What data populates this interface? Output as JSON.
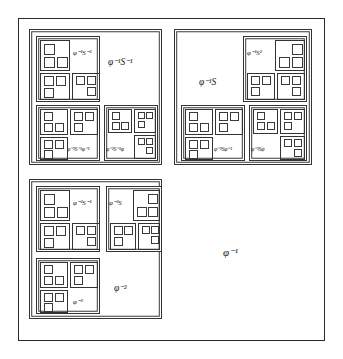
{
  "figure": {
    "frame": {
      "x": 18,
      "y": 18,
      "w": 307,
      "h": 323
    },
    "stroke_color": "#333333",
    "background_color": "#ffffff",
    "text_color": "#1a1a1a"
  },
  "labels": {
    "root": "φ⁻¹",
    "top_left_region": "φ⁻¹S⁻¹",
    "top_left_inner": "φ⁻¹S⁻²",
    "top_left_bl": "φ⁻¹S⁻¹φ⁻¹",
    "top_left_br": "φ⁻¹S⁻¹φ",
    "top_right_region": "φ⁻¹S",
    "top_right_inner": "φ⁻¹S²",
    "top_right_bl": "φ⁻¹Sφ⁻¹",
    "top_right_br": "φ⁻¹Sφ",
    "bottom_left_region": "φ⁻²",
    "bottom_left_inner": "φ⁻²S⁻¹",
    "bottom_left_mid": "φ⁻²S",
    "bottom_left_low": "φ⁻³"
  },
  "label_parts": {
    "root": {
      "base": "φ",
      "exp": "-1"
    },
    "top_left_region": {
      "base": "φ",
      "exp": "-1",
      "mid": "S",
      "exp2": "-1"
    },
    "top_left_inner": {
      "base": "φ",
      "exp": "-1",
      "mid": "S",
      "exp2": "-2"
    },
    "top_right_region": {
      "base": "φ",
      "exp": "-1",
      "mid": "S"
    },
    "top_right_inner": {
      "base": "φ",
      "exp": "-1",
      "mid": "S",
      "exp2": "2"
    },
    "bottom_left_region": {
      "base": "φ",
      "exp": "-2"
    },
    "bottom_left_inner": {
      "base": "φ",
      "exp": "-2",
      "mid": "S",
      "exp2": "-1"
    },
    "bottom_left_mid": {
      "base": "φ",
      "exp": "-2",
      "mid": "S"
    },
    "bottom_left_low": {
      "base": "φ",
      "exp": "-3"
    }
  },
  "structure": {
    "description": "Each region is subdivided into three sub-regions placed top-left, bottom-left and bottom-right; the empty top-right quadrant carries the region label.",
    "depth": 4,
    "children_per_node": 3,
    "child_positions": [
      "top-left",
      "bottom-left",
      "bottom-right"
    ],
    "label_position": "top-right"
  }
}
